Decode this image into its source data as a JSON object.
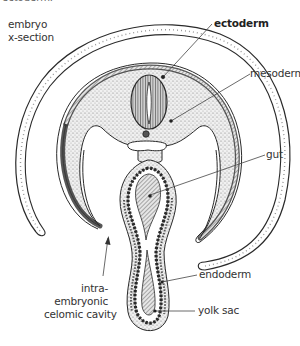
{
  "diagram": {
    "type": "anatomical-cross-section",
    "subject": "embryo x-section",
    "top_cutoff_text": "ectoderm.",
    "labels": [
      {
        "id": "embryo",
        "text_lines": [
          "embryo",
          "x-section"
        ]
      },
      {
        "id": "ectoderm",
        "text_lines": [
          "ectoderm"
        ],
        "bold": true
      },
      {
        "id": "mesoderm",
        "text_lines": [
          "mesoderm"
        ]
      },
      {
        "id": "gut",
        "text_lines": [
          "gut"
        ]
      },
      {
        "id": "intraembryonic",
        "text_lines": [
          "intra-",
          "embryonic",
          "celomic cavity"
        ]
      },
      {
        "id": "endoderm",
        "text_lines": [
          "endoderm"
        ]
      },
      {
        "id": "yolk-sac",
        "text_lines": [
          "yolk sac"
        ]
      }
    ],
    "colors": {
      "line": "#2a2a2a",
      "stipple": "#b8b8b8",
      "background": "#ffffff"
    }
  }
}
